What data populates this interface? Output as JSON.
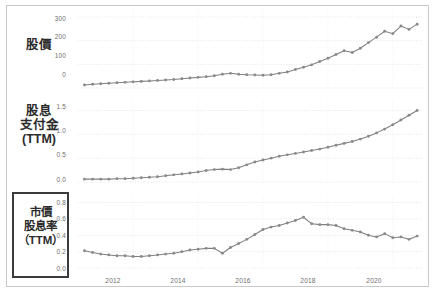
{
  "figure": {
    "background_color": "#ffffff",
    "frame_color": "#c9c9c9",
    "series_color": "#808080",
    "marker_color": "#8a8a8a",
    "grid_color": "#e2d7d7",
    "tick_color": "#6e6e6e",
    "highlight_border_color": "#3b3b3b"
  },
  "row_labels": {
    "price": [
      "股價"
    ],
    "dividend": [
      "股息",
      "支付金",
      "(TTM)"
    ],
    "yield": [
      "市價",
      "股息率",
      "（TTM）"
    ]
  },
  "xaxis": {
    "ticks": [
      "2012",
      "2014",
      "2016",
      "2018",
      "2020"
    ],
    "tick_values": [
      2012,
      2014,
      2016,
      2018,
      2020
    ],
    "range": [
      2010.3,
      2020.9
    ]
  },
  "chart_data": [
    {
      "type": "line",
      "title": "股價",
      "xlabel": "",
      "ylabel": "股價",
      "ylim": [
        0,
        330
      ],
      "yticks": [
        0,
        100,
        200,
        300
      ],
      "ytick_labels": [
        "0",
        "100",
        "200",
        "300"
      ],
      "grid": true,
      "legend": "none",
      "markers": true,
      "x": [
        2010.5,
        2010.75,
        2011.0,
        2011.25,
        2011.5,
        2011.75,
        2012.0,
        2012.25,
        2012.5,
        2012.75,
        2013.0,
        2013.25,
        2013.5,
        2013.75,
        2014.0,
        2014.25,
        2014.5,
        2014.75,
        2015.0,
        2015.25,
        2015.5,
        2015.75,
        2016.0,
        2016.25,
        2016.5,
        2016.75,
        2017.0,
        2017.25,
        2017.5,
        2017.75,
        2018.0,
        2018.25,
        2018.5,
        2018.75,
        2019.0,
        2019.25,
        2019.5,
        2019.75,
        2020.0,
        2020.25,
        2020.5,
        2020.75
      ],
      "values": [
        13,
        16,
        18,
        20,
        22,
        24,
        26,
        28,
        30,
        32,
        34,
        36,
        39,
        42,
        45,
        48,
        52,
        58,
        62,
        58,
        56,
        55,
        54,
        56,
        62,
        68,
        78,
        88,
        98,
        112,
        126,
        142,
        158,
        150,
        168,
        192,
        215,
        240,
        230,
        262,
        248,
        270
      ]
    },
    {
      "type": "line",
      "title": "股息支付金 (TTM)",
      "xlabel": "",
      "ylabel": "股息支付金(TTM)",
      "ylim": [
        0,
        1.72
      ],
      "yticks": [
        0.0,
        0.5,
        1.0,
        1.5
      ],
      "ytick_labels": [
        "0.0",
        "0.5",
        "1.0",
        "1.5"
      ],
      "grid": true,
      "legend": "none",
      "markers": true,
      "x": [
        2010.5,
        2010.75,
        2011.0,
        2011.25,
        2011.5,
        2011.75,
        2012.0,
        2012.25,
        2012.5,
        2012.75,
        2013.0,
        2013.25,
        2013.5,
        2013.75,
        2014.0,
        2014.25,
        2014.5,
        2014.75,
        2015.0,
        2015.25,
        2015.5,
        2015.75,
        2016.0,
        2016.25,
        2016.5,
        2016.75,
        2017.0,
        2017.25,
        2017.5,
        2017.75,
        2018.0,
        2018.25,
        2018.5,
        2018.75,
        2019.0,
        2019.25,
        2019.5,
        2019.75,
        2020.0,
        2020.25,
        2020.5,
        2020.75
      ],
      "values": [
        0.06,
        0.06,
        0.06,
        0.06,
        0.07,
        0.07,
        0.08,
        0.09,
        0.1,
        0.11,
        0.13,
        0.15,
        0.17,
        0.19,
        0.21,
        0.24,
        0.26,
        0.27,
        0.26,
        0.3,
        0.36,
        0.42,
        0.46,
        0.5,
        0.54,
        0.57,
        0.6,
        0.63,
        0.66,
        0.69,
        0.73,
        0.77,
        0.81,
        0.85,
        0.9,
        0.96,
        1.03,
        1.11,
        1.2,
        1.3,
        1.4,
        1.5
      ]
    },
    {
      "type": "line",
      "title": "市價股息率 (TTM)",
      "xlabel": "",
      "ylabel": "市價股息率(TTM)",
      "ylim": [
        0,
        0.88
      ],
      "yticks": [
        0.0,
        0.2,
        0.4,
        0.6,
        0.8
      ],
      "ytick_labels": [
        "0.0",
        "0.2",
        "0.4",
        "0.6",
        "0.8"
      ],
      "grid": true,
      "legend": "none",
      "markers": true,
      "x": [
        2010.5,
        2010.75,
        2011.0,
        2011.25,
        2011.5,
        2011.75,
        2012.0,
        2012.25,
        2012.5,
        2012.75,
        2013.0,
        2013.25,
        2013.5,
        2013.75,
        2014.0,
        2014.25,
        2014.5,
        2014.75,
        2015.0,
        2015.25,
        2015.5,
        2015.75,
        2016.0,
        2016.25,
        2016.5,
        2016.75,
        2017.0,
        2017.25,
        2017.5,
        2017.75,
        2018.0,
        2018.25,
        2018.5,
        2018.75,
        2019.0,
        2019.25,
        2019.5,
        2019.75,
        2020.0,
        2020.25,
        2020.5,
        2020.75
      ],
      "values": [
        0.21,
        0.19,
        0.17,
        0.16,
        0.15,
        0.15,
        0.14,
        0.14,
        0.15,
        0.16,
        0.17,
        0.18,
        0.2,
        0.22,
        0.23,
        0.24,
        0.24,
        0.18,
        0.25,
        0.3,
        0.35,
        0.41,
        0.47,
        0.5,
        0.52,
        0.55,
        0.58,
        0.62,
        0.54,
        0.53,
        0.53,
        0.52,
        0.48,
        0.46,
        0.44,
        0.4,
        0.38,
        0.42,
        0.37,
        0.38,
        0.35,
        0.39
      ]
    }
  ]
}
